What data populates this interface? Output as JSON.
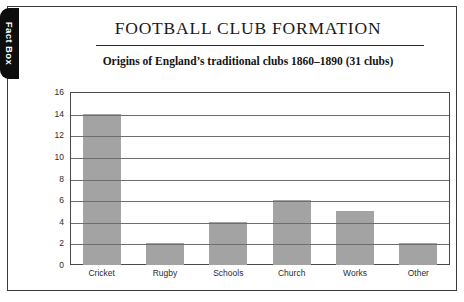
{
  "tab": {
    "label": "Fact Box"
  },
  "header": {
    "title": "FOOTBALL CLUB FORMATION",
    "subtitle": "Origins of England’s traditional clubs 1860–1890 (31 clubs)"
  },
  "colors": {
    "bar_fill": "#a3a3a3",
    "tab_background": "#0d0d0d",
    "tab_text": "#ffffff",
    "frame_border": "#3a3a3a",
    "gridline": "#6e6e6e"
  },
  "chart_data": {
    "type": "bar",
    "title": "FOOTBALL CLUB FORMATION",
    "subtitle": "Origins of England’s traditional clubs 1860–1890 (31 clubs)",
    "categories": [
      "Cricket",
      "Rugby",
      "Schools",
      "Church",
      "Works",
      "Other"
    ],
    "values": [
      14,
      2,
      4,
      6,
      5,
      2
    ],
    "xlabel": "",
    "ylabel": "",
    "ylim": [
      0,
      16
    ],
    "yticks": [
      0,
      2,
      4,
      6,
      8,
      10,
      12,
      14,
      16
    ],
    "ytick_labels": [
      "0",
      "2",
      "4",
      "6",
      "8",
      "10",
      "12",
      "14",
      "16"
    ],
    "grid": true,
    "legend": false
  }
}
